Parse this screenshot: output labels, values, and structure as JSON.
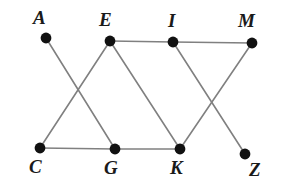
{
  "diagram": {
    "type": "undirected-graph",
    "title": "",
    "canvas": {
      "width": 294,
      "height": 196,
      "background": "#ffffff"
    },
    "style": {
      "edge_color": "#808080",
      "edge_width": 1.6,
      "vertex_color": "#111111",
      "vertex_radius": 5.4,
      "label_color": "#1a1a1a"
    },
    "vertices": [
      {
        "id": "A",
        "label": "A",
        "x": 46,
        "y": 38,
        "label_x": 33,
        "label_y": 8,
        "label_pos": "above-left"
      },
      {
        "id": "E",
        "label": "E",
        "x": 110,
        "y": 41,
        "label_x": 99,
        "label_y": 10,
        "label_pos": "above-left"
      },
      {
        "id": "I",
        "label": "I",
        "x": 173,
        "y": 42,
        "label_x": 168,
        "label_y": 11,
        "label_pos": "above"
      },
      {
        "id": "M",
        "label": "M",
        "x": 252,
        "y": 43,
        "label_x": 238,
        "label_y": 11,
        "label_pos": "above-left"
      },
      {
        "id": "C",
        "label": "C",
        "x": 40,
        "y": 148,
        "label_x": 29,
        "label_y": 157,
        "label_pos": "below-left"
      },
      {
        "id": "G",
        "label": "G",
        "x": 115,
        "y": 149,
        "label_x": 104,
        "label_y": 158,
        "label_pos": "below-left"
      },
      {
        "id": "K",
        "label": "K",
        "x": 180,
        "y": 149,
        "label_x": 170,
        "label_y": 158,
        "label_pos": "below-left"
      },
      {
        "id": "Z",
        "label": "Z",
        "x": 245,
        "y": 154,
        "label_x": 249,
        "label_y": 160,
        "label_pos": "below-right"
      }
    ],
    "edges": [
      {
        "from": "A",
        "to": "G"
      },
      {
        "from": "E",
        "to": "C"
      },
      {
        "from": "E",
        "to": "I"
      },
      {
        "from": "E",
        "to": "K"
      },
      {
        "from": "C",
        "to": "G"
      },
      {
        "from": "G",
        "to": "K"
      },
      {
        "from": "I",
        "to": "M"
      },
      {
        "from": "I",
        "to": "Z"
      },
      {
        "from": "M",
        "to": "K"
      }
    ]
  }
}
